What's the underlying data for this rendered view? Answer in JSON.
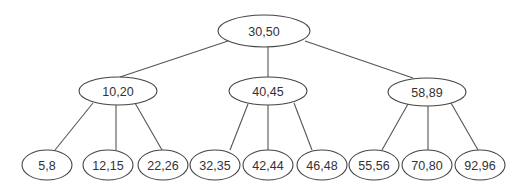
{
  "diagram": {
    "type": "tree",
    "colors": {
      "edge": "#555555",
      "node_stroke": "#444444",
      "node_fill": "#ffffff",
      "text": "#333333"
    },
    "nodes": [
      {
        "id": "root",
        "label": "30,50",
        "cx": 264,
        "cy": 31,
        "rx": 46,
        "ry": 16
      },
      {
        "id": "l",
        "label": "10,20",
        "cx": 118,
        "cy": 91,
        "rx": 39,
        "ry": 14
      },
      {
        "id": "m",
        "label": "40,45",
        "cx": 268,
        "cy": 91,
        "rx": 39,
        "ry": 14
      },
      {
        "id": "r",
        "label": "58,89",
        "cx": 427,
        "cy": 92,
        "rx": 39,
        "ry": 14
      },
      {
        "id": "l1",
        "label": "5,8",
        "cx": 47,
        "cy": 165,
        "rx": 25,
        "ry": 15
      },
      {
        "id": "l2",
        "label": "12,15",
        "cx": 108,
        "cy": 165,
        "rx": 25,
        "ry": 15
      },
      {
        "id": "l3",
        "label": "22,26",
        "cx": 163,
        "cy": 165,
        "rx": 25,
        "ry": 15
      },
      {
        "id": "m1",
        "label": "32,35",
        "cx": 215,
        "cy": 165,
        "rx": 25,
        "ry": 15
      },
      {
        "id": "m2",
        "label": "42,44",
        "cx": 268,
        "cy": 165,
        "rx": 25,
        "ry": 15
      },
      {
        "id": "m3",
        "label": "46,48",
        "cx": 322,
        "cy": 165,
        "rx": 25,
        "ry": 15
      },
      {
        "id": "r1",
        "label": "55,56",
        "cx": 374,
        "cy": 165,
        "rx": 25,
        "ry": 15
      },
      {
        "id": "r2",
        "label": "70,80",
        "cx": 427,
        "cy": 165,
        "rx": 25,
        "ry": 15
      },
      {
        "id": "r3",
        "label": "92,96",
        "cx": 480,
        "cy": 165,
        "rx": 25,
        "ry": 15
      }
    ],
    "edges": [
      {
        "from": "root",
        "to": "l",
        "x1": 228,
        "y1": 41,
        "x2": 120,
        "y2": 77
      },
      {
        "from": "root",
        "to": "m",
        "x1": 268,
        "y1": 47,
        "x2": 268,
        "y2": 77
      },
      {
        "from": "root",
        "to": "r",
        "x1": 305,
        "y1": 41,
        "x2": 413,
        "y2": 78
      },
      {
        "from": "l",
        "to": "l1",
        "x1": 93,
        "y1": 103,
        "x2": 55,
        "y2": 150
      },
      {
        "from": "l",
        "to": "l2",
        "x1": 116,
        "y1": 105,
        "x2": 116,
        "y2": 150
      },
      {
        "from": "l",
        "to": "l3",
        "x1": 135,
        "y1": 103,
        "x2": 162,
        "y2": 150
      },
      {
        "from": "m",
        "to": "m1",
        "x1": 248,
        "y1": 104,
        "x2": 230,
        "y2": 150
      },
      {
        "from": "m",
        "to": "m2",
        "x1": 268,
        "y1": 105,
        "x2": 268,
        "y2": 150
      },
      {
        "from": "m",
        "to": "m3",
        "x1": 294,
        "y1": 103,
        "x2": 312,
        "y2": 150
      },
      {
        "from": "r",
        "to": "r1",
        "x1": 408,
        "y1": 104,
        "x2": 382,
        "y2": 150
      },
      {
        "from": "r",
        "to": "r2",
        "x1": 428,
        "y1": 106,
        "x2": 428,
        "y2": 150
      },
      {
        "from": "r",
        "to": "r3",
        "x1": 451,
        "y1": 103,
        "x2": 478,
        "y2": 150
      }
    ]
  }
}
